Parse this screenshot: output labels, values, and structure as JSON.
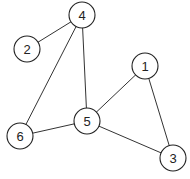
{
  "graph": {
    "node_radius": 13,
    "nodes": [
      {
        "id": "1",
        "label": "1",
        "x": 145,
        "y": 66
      },
      {
        "id": "2",
        "label": "2",
        "x": 27,
        "y": 49
      },
      {
        "id": "3",
        "label": "3",
        "x": 173,
        "y": 158
      },
      {
        "id": "4",
        "label": "4",
        "x": 82,
        "y": 15
      },
      {
        "id": "5",
        "label": "5",
        "x": 87,
        "y": 121
      },
      {
        "id": "6",
        "label": "6",
        "x": 20,
        "y": 136
      }
    ],
    "edges": [
      [
        "4",
        "2"
      ],
      [
        "4",
        "6"
      ],
      [
        "4",
        "5"
      ],
      [
        "5",
        "6"
      ],
      [
        "5",
        "1"
      ],
      [
        "5",
        "3"
      ],
      [
        "1",
        "3"
      ]
    ]
  }
}
